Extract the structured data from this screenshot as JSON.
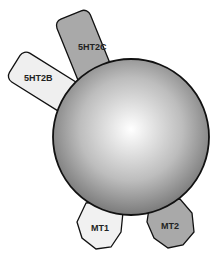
{
  "diagram": {
    "center": {
      "label": "",
      "fill_light": "#ffffff",
      "fill_dark": "#777777",
      "stroke": "#111111"
    },
    "receptors": [
      {
        "id": "5ht2c",
        "label": "5HT2C",
        "shape": "rounded-rect",
        "fill": "#a9a9a9"
      },
      {
        "id": "5ht2b",
        "label": "5HT2B",
        "shape": "rounded-rect",
        "fill": "#efefef"
      },
      {
        "id": "mt1",
        "label": "MT1",
        "shape": "octagon",
        "fill": "#f1f1f1"
      },
      {
        "id": "mt2",
        "label": "MT2",
        "shape": "octagon",
        "fill": "#a9a9a9"
      }
    ]
  }
}
